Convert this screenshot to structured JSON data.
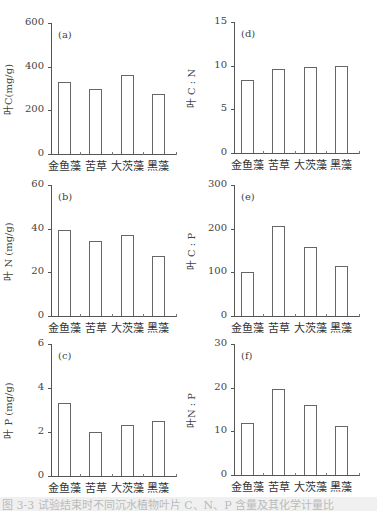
{
  "categories": [
    "金鱼藻",
    "苦草",
    "大茨藻",
    "黑藻"
  ],
  "chart_data": [
    {
      "id": "a",
      "type": "bar",
      "panel_label": "(a)",
      "title": "",
      "xlabel": "",
      "ylabel": "叶C(mg/g)",
      "categories": [
        "金鱼藻",
        "苦草",
        "大茨藻",
        "黑藻"
      ],
      "values": [
        332,
        300,
        364,
        277
      ],
      "ylim": [
        0,
        600
      ],
      "yticks": [
        0,
        200,
        400,
        600
      ],
      "grid": false,
      "legend": null
    },
    {
      "id": "b",
      "type": "bar",
      "panel_label": "(b)",
      "title": "",
      "xlabel": "",
      "ylabel": "叶 N (mg/g)",
      "categories": [
        "金鱼藻",
        "苦草",
        "大茨藻",
        "黑藻"
      ],
      "values": [
        39.5,
        34.5,
        37.2,
        27.3
      ],
      "ylim": [
        0,
        60
      ],
      "yticks": [
        0,
        20,
        40,
        60
      ],
      "grid": false,
      "legend": null
    },
    {
      "id": "c",
      "type": "bar",
      "panel_label": "(c)",
      "title": "",
      "xlabel": "",
      "ylabel": "叶 P (mg/g)",
      "categories": [
        "金鱼藻",
        "苦草",
        "大茨藻",
        "黑藻"
      ],
      "values": [
        3.3,
        2.0,
        2.3,
        2.5
      ],
      "ylim": [
        0,
        6
      ],
      "yticks": [
        0,
        2,
        4,
        6
      ],
      "grid": false,
      "legend": null
    },
    {
      "id": "d",
      "type": "bar",
      "panel_label": "(d)",
      "title": "",
      "xlabel": "",
      "ylabel": "叶 C : N",
      "categories": [
        "金鱼藻",
        "苦草",
        "大茨藻",
        "黑藻"
      ],
      "values": [
        8.4,
        9.6,
        9.8,
        10.0
      ],
      "ylim": [
        0,
        15
      ],
      "yticks": [
        0,
        5,
        10,
        15
      ],
      "grid": false,
      "legend": null
    },
    {
      "id": "e",
      "type": "bar",
      "panel_label": "(e)",
      "title": "",
      "xlabel": "",
      "ylabel": "叶 C : P",
      "categories": [
        "金鱼藻",
        "苦草",
        "大茨藻",
        "黑藻"
      ],
      "values": [
        100,
        207,
        157,
        114
      ],
      "ylim": [
        0,
        300
      ],
      "yticks": [
        0,
        100,
        200,
        300
      ],
      "grid": false,
      "legend": null
    },
    {
      "id": "f",
      "type": "bar",
      "panel_label": "(f)",
      "title": "",
      "xlabel": "",
      "ylabel": "叶N : P",
      "categories": [
        "金鱼藻",
        "苦草",
        "大茨藻",
        "黑藻"
      ],
      "values": [
        11.9,
        19.8,
        16.0,
        11.2
      ],
      "ylim": [
        0,
        30
      ],
      "yticks": [
        0,
        10,
        20,
        30
      ],
      "grid": false,
      "legend": null
    }
  ],
  "caption": "图 3-3 试验结束时不同沉水植物叶片 C、N、P 含量及其化学计量比"
}
